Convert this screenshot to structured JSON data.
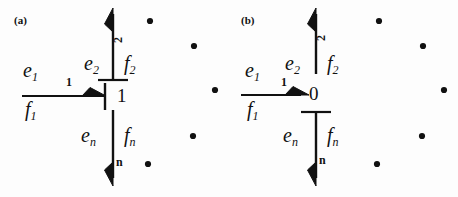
{
  "figure": {
    "type": "bond-graph-diagram",
    "width": 458,
    "height": 197,
    "background": "#ffffff",
    "ink_color": "#111111"
  },
  "panels": [
    {
      "id": "a",
      "label": "(a)",
      "junction": {
        "symbol": "1",
        "name": "one-junction",
        "causality": {
          "bond1_stroke": "vertical-bar-at-junction-left",
          "bond2_stroke": "horizontal-bar-above-junction",
          "bondn_stroke": "none"
        }
      },
      "bonds": [
        {
          "number": "1",
          "effort": "e",
          "effort_sub": "1",
          "flow": "f",
          "flow_sub": "1",
          "direction": "right",
          "orientation": "horizontal",
          "half_arrow_side": "upper"
        },
        {
          "number": "2",
          "effort": "e",
          "effort_sub": "2",
          "flow": "f",
          "flow_sub": "2",
          "direction": "up",
          "orientation": "vertical",
          "half_arrow_side": "left"
        },
        {
          "number": "n",
          "effort": "e",
          "effort_sub": "n",
          "flow": "f",
          "flow_sub": "n",
          "direction": "down",
          "orientation": "vertical",
          "half_arrow_side": "left"
        }
      ],
      "ellipsis_dots": [
        {
          "cx": 150,
          "cy": 21
        },
        {
          "cx": 194,
          "cy": 46
        },
        {
          "cx": 215,
          "cy": 90
        },
        {
          "cx": 193,
          "cy": 136
        },
        {
          "cx": 148,
          "cy": 164
        }
      ]
    },
    {
      "id": "b",
      "label": "(b)",
      "junction": {
        "symbol": "0",
        "name": "zero-junction",
        "causality": {
          "bond1_stroke": "none",
          "bond2_stroke": "none",
          "bondn_stroke": "horizontal-bar-below-junction"
        }
      },
      "bonds": [
        {
          "number": "1",
          "effort": "e",
          "effort_sub": "1",
          "flow": "f",
          "flow_sub": "1",
          "direction": "right",
          "orientation": "horizontal",
          "half_arrow_side": "upper"
        },
        {
          "number": "2",
          "effort": "e",
          "effort_sub": "2",
          "flow": "f",
          "flow_sub": "2",
          "direction": "up",
          "orientation": "vertical",
          "half_arrow_side": "left"
        },
        {
          "number": "n",
          "effort": "e",
          "effort_sub": "n",
          "flow": "f",
          "flow_sub": "n",
          "direction": "down",
          "orientation": "vertical",
          "half_arrow_side": "left"
        }
      ],
      "ellipsis_dots": [
        {
          "cx": 150,
          "cy": 21
        },
        {
          "cx": 194,
          "cy": 46
        },
        {
          "cx": 215,
          "cy": 90
        },
        {
          "cx": 193,
          "cy": 136
        },
        {
          "cx": 148,
          "cy": 164
        }
      ]
    }
  ]
}
